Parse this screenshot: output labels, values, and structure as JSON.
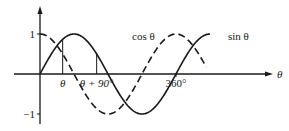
{
  "chart_data": {
    "type": "line",
    "title": "",
    "xlabel": "θ",
    "ylabel": "",
    "x_unit": "degrees",
    "xlim": [
      0,
      450
    ],
    "ylim": [
      -1,
      1
    ],
    "grid": false,
    "y_ticks": [
      {
        "value": 1,
        "label": "1"
      },
      {
        "value": -1,
        "label": "−1"
      }
    ],
    "x_annotations": [
      {
        "value": 60,
        "label": "θ",
        "marker": "vertical line from axis to sin curve"
      },
      {
        "value": 150,
        "label": "θ + 90°",
        "marker": "vertical line from axis to sin curve"
      },
      {
        "value": 360,
        "label": "360°",
        "marker": "tick"
      }
    ],
    "series": [
      {
        "name": "sin θ",
        "label": "sin θ",
        "style": "solid",
        "function": "sin",
        "x_range": [
          0,
          450
        ]
      },
      {
        "name": "cos θ",
        "label": "cos θ",
        "style": "dashed",
        "function": "cos",
        "x_range": [
          0,
          440
        ]
      }
    ]
  }
}
